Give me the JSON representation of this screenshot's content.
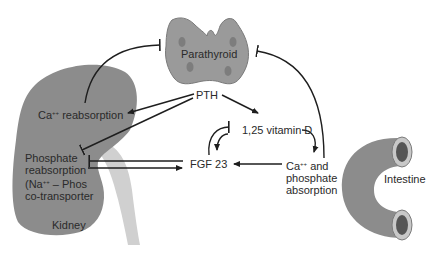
{
  "diagram": {
    "organs": {
      "parathyroid": "Parathyroid",
      "kidney": "Kidney",
      "intestine": "Intestine"
    },
    "nodes": {
      "pth": "PTH",
      "vitamin_d": "1,25 vitamin D",
      "fgf23": "FGF 23",
      "ca_reabsorption": "reabsorption",
      "ca_prefix": "Ca",
      "ca_sup": "++",
      "phosphate_line1": "Phosphate",
      "phosphate_line2": "reabsorption",
      "phosphate_line3_prefix": "(Na",
      "phosphate_line3_sup": "++",
      "phosphate_line3_suffix": " – Phos",
      "phosphate_line4": "co-transporter",
      "absorption_line1_suffix": " and",
      "absorption_line2": "phosphate",
      "absorption_line3": "absorption"
    },
    "colors": {
      "organ_fill": "#8c8c8c",
      "organ_stroke": "#7a7a7a",
      "ureter_fill": "#cfcfcf",
      "arrow": "#1e1e1e",
      "text": "#2a2a2a"
    }
  }
}
